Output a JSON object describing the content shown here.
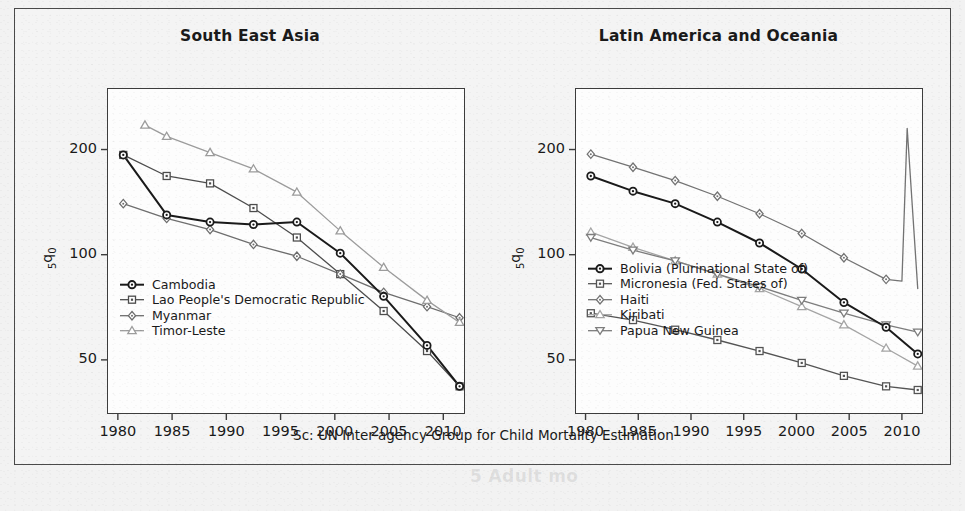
{
  "figure": {
    "caption": "Sc: UN Inter-agency Group for Child Mortality Estimation",
    "ghost_text": "5 Adult mo"
  },
  "chart_data": [
    {
      "type": "line",
      "panel": "left",
      "title": "South East Asia",
      "xlabel": "",
      "ylabel": "5q0",
      "yscale": "log",
      "ylim": [
        35,
        300
      ],
      "yticks": [
        50,
        100,
        200
      ],
      "ytick_labels": [
        "50",
        "100",
        "200"
      ],
      "xlim": [
        1979,
        2012
      ],
      "xticks": [
        1980,
        1985,
        1990,
        1995,
        2000,
        2005,
        2010
      ],
      "xtick_labels": [
        "1980",
        "1985",
        "1990",
        "1995",
        "2000",
        "2005",
        "2010"
      ],
      "grid": false,
      "legend_position": "bottom-left",
      "series": [
        {
          "name": "Cambodia",
          "marker": "circle",
          "color": "#1a1a1a",
          "linewidth": 2.0,
          "x": [
            1980.5,
            1984.5,
            1988.5,
            1992.5,
            1996.5,
            2000.5,
            2004.5,
            2008.5,
            2011.5
          ],
          "y": [
            193,
            130,
            124,
            122,
            124,
            101,
            76,
            55,
            42
          ]
        },
        {
          "name": "Lao People's Democratic Republic",
          "marker": "square",
          "color": "#4d4d4d",
          "linewidth": 1.3,
          "x": [
            1980.5,
            1984.5,
            1988.5,
            1992.5,
            1996.5,
            2000.5,
            2004.5,
            2008.5,
            2011.5
          ],
          "y": [
            193,
            168,
            160,
            136,
            112,
            88,
            69,
            53,
            42
          ]
        },
        {
          "name": "Myanmar",
          "marker": "diamond",
          "color": "#6e6e6e",
          "linewidth": 1.3,
          "x": [
            1980.5,
            1984.5,
            1988.5,
            1992.5,
            1996.5,
            2000.5,
            2004.5,
            2008.5,
            2011.5
          ],
          "y": [
            140,
            127,
            118,
            107,
            99,
            88,
            78,
            71,
            66
          ]
        },
        {
          "name": "Timor-Leste",
          "marker": "triangle-up",
          "color": "#9c9c9c",
          "linewidth": 1.3,
          "x": [
            1982.5,
            1984.5,
            1988.5,
            1992.5,
            1996.5,
            2000.5,
            2004.5,
            2008.5,
            2011.5
          ],
          "y": [
            235,
            218,
            196,
            176,
            151,
            117,
            92,
            74,
            64
          ]
        }
      ]
    },
    {
      "type": "line",
      "panel": "right",
      "title": "Latin America and Oceania",
      "xlabel": "",
      "ylabel": "5q0",
      "yscale": "log",
      "ylim": [
        35,
        300
      ],
      "yticks": [
        50,
        100,
        200
      ],
      "ytick_labels": [
        "50",
        "100",
        "200"
      ],
      "xlim": [
        1979,
        2012
      ],
      "xticks": [
        1980,
        1985,
        1990,
        1995,
        2000,
        2005,
        2010
      ],
      "xtick_labels": [
        "1980",
        "1985",
        "1990",
        "1995",
        "2000",
        "2005",
        "2010"
      ],
      "grid": false,
      "legend_position": "bottom-left",
      "series": [
        {
          "name": "Bolivia (Plurinational State of)",
          "marker": "circle",
          "color": "#1a1a1a",
          "linewidth": 2.0,
          "x": [
            1980.5,
            1984.5,
            1988.5,
            1992.5,
            1996.5,
            2000.5,
            2004.5,
            2008.5,
            2011.5
          ],
          "y": [
            168,
            152,
            140,
            124,
            108,
            91,
            73,
            62,
            52
          ]
        },
        {
          "name": "Micronesia (Fed. States of)",
          "marker": "square",
          "color": "#545454",
          "linewidth": 1.3,
          "x": [
            1980.5,
            1984.5,
            1988.5,
            1992.5,
            1996.5,
            2000.5,
            2004.5,
            2008.5,
            2011.5
          ],
          "y": [
            68,
            65,
            61,
            57,
            53,
            49,
            45,
            42,
            41
          ]
        },
        {
          "name": "Haiti",
          "marker": "diamond",
          "color": "#737373",
          "linewidth": 1.3,
          "x": [
            1980.5,
            1984.5,
            1988.5,
            1992.5,
            1996.5,
            2000.5,
            2004.5,
            2008.5,
            2010.0,
            2010.5,
            2011.5
          ],
          "y": [
            194,
            178,
            163,
            147,
            131,
            115,
            98,
            85,
            84,
            230,
            80
          ]
        },
        {
          "name": "Kiribati",
          "marker": "triangle-up",
          "color": "#a5a5a5",
          "linewidth": 1.3,
          "x": [
            1980.5,
            1984.5,
            1988.5,
            1992.5,
            1996.5,
            2000.5,
            2004.5,
            2008.5,
            2011.5
          ],
          "y": [
            116,
            105,
            96,
            88,
            80,
            71,
            63,
            54,
            48
          ]
        },
        {
          "name": "Papua New Guinea",
          "marker": "triangle-down",
          "color": "#7d7d7d",
          "linewidth": 1.3,
          "x": [
            1980.5,
            1984.5,
            1988.5,
            1992.5,
            1996.5,
            2000.5,
            2004.5,
            2008.5,
            2011.5
          ],
          "y": [
            112,
            103,
            96,
            88,
            81,
            74,
            68,
            63,
            60
          ]
        }
      ]
    }
  ]
}
